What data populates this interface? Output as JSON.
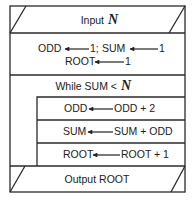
{
  "diagram": {
    "type": "structured-flowchart (Nassi-Shneiderman style)",
    "input": {
      "label": "Input",
      "variable": "N"
    },
    "init": {
      "line1": {
        "left1": "ODD",
        "right1": "1;",
        "left2": "SUM",
        "right2": "1"
      },
      "line2": {
        "left": "ROOT",
        "right": "1"
      }
    },
    "loop": {
      "header": {
        "label": "While SUM <",
        "variable": "N"
      },
      "body": [
        {
          "target": "ODD",
          "expr": "ODD + 2"
        },
        {
          "target": "SUM",
          "expr": "SUM + ODD"
        },
        {
          "target": "ROOT",
          "expr": "ROOT + 1"
        }
      ]
    },
    "output": {
      "label": "Output ROOT"
    },
    "arrow_symbol": "left-arrow (assignment)"
  }
}
